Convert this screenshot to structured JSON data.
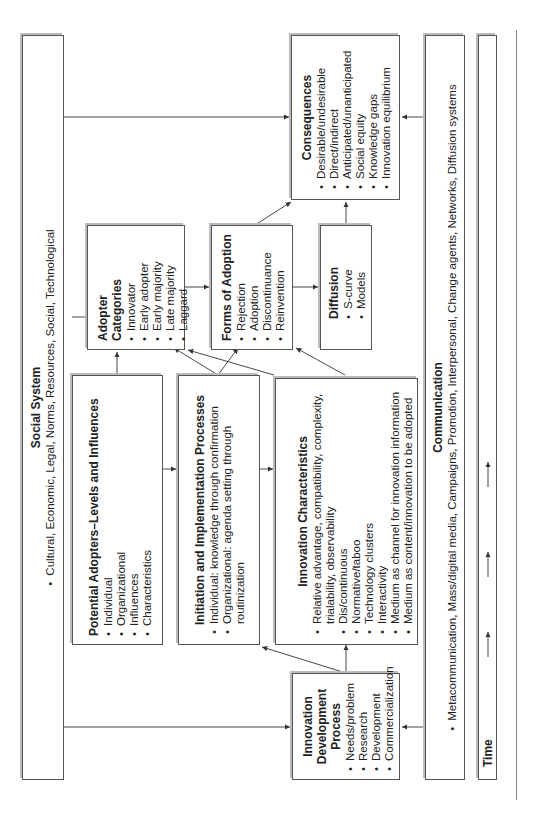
{
  "social_system": {
    "title": "Social System",
    "items": [
      "Cultural, Economic, Legal, Norms, Resources, Social, Technological"
    ]
  },
  "potential_adopters": {
    "title": "Potential Adopters–Levels and Influences",
    "items": [
      "Individual",
      "Organizational",
      "Influences",
      "Characteristics"
    ]
  },
  "initiation": {
    "title": "Initiation and Implementation Processes",
    "items": [
      "Individual: knowledge through confirmation",
      "Organizational: agenda setting through routinization"
    ]
  },
  "innovation_characteristics": {
    "title": "Innovation Characteristics",
    "items": [
      "Relative advantage, compatibility, complexity, trialability, observability",
      "Dis/continuous",
      "Normative/taboo",
      "Technology clusters",
      "Interactivity",
      "Medium as channel for innovation information",
      "Medium as content/innovation to be adopted"
    ]
  },
  "innovation_development": {
    "title": "Innovation Development Process",
    "items": [
      "Needs/problem",
      "Research",
      "Development",
      "Commercialization"
    ]
  },
  "adopter_categories": {
    "title": "Adopter Categories",
    "items": [
      "Innovator",
      "Early adopter",
      "Early majority",
      "Late majority",
      "Laggard"
    ]
  },
  "forms_of_adoption": {
    "title": "Forms of Adoption",
    "items": [
      "Rejection",
      "Adoption",
      "Discontinuance",
      "Reinvention"
    ]
  },
  "diffusion": {
    "title": "Diffusion",
    "items": [
      "S-curve",
      "Models"
    ]
  },
  "consequences": {
    "title": "Consequences",
    "items": [
      "Desirable/undesirable",
      "Direct/indirect",
      "Anticipated/unanticipated",
      "Social equity",
      "Knowledge gaps",
      "Innovation equilibrium"
    ]
  },
  "communication": {
    "title": "Communication",
    "items": [
      "Metacommunication, Mass/digital media, Campaigns, Promotion, Interpersonal, Change agents, Networks, Diffusion systems"
    ]
  },
  "time": {
    "title": "Time"
  }
}
